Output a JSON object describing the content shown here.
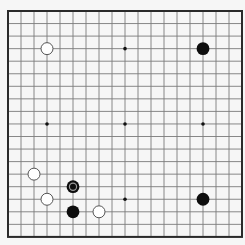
{
  "game": "go",
  "board": {
    "size": 19,
    "origin_x": 8,
    "origin_y": 11,
    "spacing_x": 13,
    "spacing_y": 12.55,
    "background": "#f6f6f6",
    "line_color": "#7a7a7a",
    "border_color": "#2a2a2a",
    "star_color": "#111111",
    "star_points": [
      [
        3,
        3
      ],
      [
        9,
        3
      ],
      [
        15,
        3
      ],
      [
        3,
        9
      ],
      [
        9,
        9
      ],
      [
        15,
        9
      ],
      [
        3,
        15
      ],
      [
        9,
        15
      ],
      [
        15,
        15
      ]
    ]
  },
  "stones": [
    {
      "color": "white",
      "col": 3,
      "row": 3
    },
    {
      "color": "black",
      "col": 15,
      "row": 3
    },
    {
      "color": "black",
      "col": 15,
      "row": 15
    },
    {
      "color": "white",
      "col": 2,
      "row": 13
    },
    {
      "color": "black",
      "col": 5,
      "row": 14,
      "last_move": true
    },
    {
      "color": "white",
      "col": 3,
      "row": 15
    },
    {
      "color": "black",
      "col": 5,
      "row": 16
    },
    {
      "color": "white",
      "col": 7,
      "row": 16
    }
  ],
  "colors": {
    "black_stone": "#0d0d0d",
    "white_stone_fill": "#ffffff",
    "white_stone_stroke": "#555555",
    "last_move_marker": "#9a9a9a"
  }
}
